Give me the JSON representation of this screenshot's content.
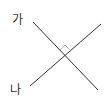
{
  "diagram": {
    "type": "perpendicular-lines",
    "lines": [
      {
        "id": "ga",
        "label": "가"
      },
      {
        "id": "na",
        "label": "나"
      }
    ],
    "angle_marker": {
      "kind": "right-angle",
      "degrees": 90
    },
    "colors": {
      "line": "#333333",
      "marker": "#bbbbbb",
      "label": "#333333"
    }
  }
}
